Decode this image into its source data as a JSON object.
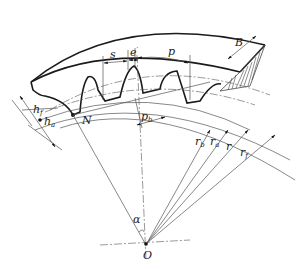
{
  "diagram": {
    "type": "spur gear tooth geometry",
    "labels": {
      "tooth_thickness": "s",
      "space_width": "e",
      "space_width_mark": "′",
      "pitch": "p",
      "face_width": "B",
      "dedendum": "h",
      "dedendum_sub": "f",
      "addendum": "h",
      "addendum_sub": "a",
      "point_n": "N",
      "base_pitch": "p",
      "base_pitch_sub": "b",
      "base_radius": "r",
      "base_radius_sub": "b",
      "tip_radius": "r",
      "tip_radius_sub": "a",
      "pitch_radius": "r",
      "root_radius": "r",
      "root_radius_sub": "f",
      "pressure_angle": "α",
      "center": "O"
    },
    "colors": {
      "line": "#1a1a1a",
      "thin": "#555555",
      "hatch": "#444444",
      "background": "#ffffff"
    }
  }
}
